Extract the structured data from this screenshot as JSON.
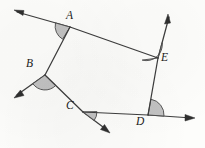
{
  "figure": {
    "canvas": {
      "width": 205,
      "height": 148
    },
    "stroke_color": "#3d3d3d",
    "angle_fill_color": "#b9b9b9",
    "angle_stroke_color": "#4a4a4a",
    "background_color": "#fdfdfb"
  },
  "vertices": [
    {
      "id": "A",
      "label": "A",
      "x": 70,
      "y": 27,
      "label_x": 66,
      "label_y": 10
    },
    {
      "id": "B",
      "label": "B",
      "x": 45,
      "y": 75,
      "label_x": 26,
      "label_y": 58
    },
    {
      "id": "C",
      "label": "C",
      "x": 83,
      "y": 112,
      "label_x": 66,
      "label_y": 100
    },
    {
      "id": "D",
      "label": "D",
      "x": 148,
      "y": 115,
      "label_x": 136,
      "label_y": 116
    },
    {
      "id": "E",
      "label": "E",
      "x": 158,
      "y": 58,
      "label_x": 161,
      "label_y": 52
    }
  ],
  "edges": [
    {
      "from": "A",
      "to": "B"
    },
    {
      "from": "B",
      "to": "C"
    },
    {
      "from": "C",
      "to": "D"
    },
    {
      "from": "D",
      "to": "E"
    },
    {
      "from": "E",
      "to": "A"
    }
  ],
  "rays": [
    {
      "id": "ray-A",
      "from_vertex": "A",
      "tip_x": 14,
      "tip_y": 10,
      "direction": "upper-left",
      "extends_edge": "E-A"
    },
    {
      "id": "ray-B",
      "from_vertex": "B",
      "tip_x": 14,
      "tip_y": 98,
      "direction": "lower-left",
      "extends_edge": "A-B"
    },
    {
      "id": "ray-C",
      "from_vertex": "C",
      "tip_x": 110,
      "tip_y": 133,
      "direction": "lower-right",
      "extends_edge": "B-C"
    },
    {
      "id": "ray-D",
      "from_vertex": "D",
      "tip_x": 195,
      "tip_y": 118,
      "direction": "right",
      "extends_edge": "C-D"
    },
    {
      "id": "ray-E",
      "from_vertex": "E",
      "tip_x": 168,
      "tip_y": 14,
      "direction": "upper-right",
      "extends_edge": "D-E"
    }
  ],
  "angle_marks": [
    {
      "id": "angle-A",
      "vertex": "A",
      "radius": 15,
      "between": [
        "ray-A",
        "B"
      ]
    },
    {
      "id": "angle-B",
      "vertex": "B",
      "radius": 15,
      "between": [
        "ray-B",
        "C"
      ]
    },
    {
      "id": "angle-C",
      "vertex": "C",
      "radius": 14,
      "between": [
        "ray-C",
        "D"
      ]
    },
    {
      "id": "angle-D",
      "vertex": "D",
      "radius": 16,
      "between": [
        "ray-D",
        "E"
      ]
    },
    {
      "id": "angle-E",
      "vertex": "E",
      "radius": 16,
      "between": [
        "ray-E",
        "A"
      ]
    }
  ]
}
